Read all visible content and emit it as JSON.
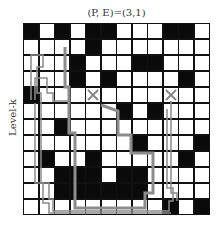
{
  "title": "(P, E)=(3,1)",
  "ylabel": "Level-k",
  "grid": {
    "rows": 12,
    "cols": 12,
    "cells": [
      "BWBWBBWWWBBW",
      "WWWWBWWWWWWW",
      "WWWBWWWBBWWW",
      "WWWBWBWWWWBW",
      "BWWWWWWWWWWW",
      "WWWWWWBWBWWW",
      "WWBWWWWWWWWW",
      "WWWWWWWBWWWB",
      "WBWWBWWWWWBW",
      "WWBBBWBBWWWW",
      "WWBBBBBBWWWW",
      "WWWWWWWWWBWB"
    ]
  },
  "markers": [
    {
      "type": "x",
      "row": 4,
      "col": 4
    },
    {
      "type": "x",
      "row": 4,
      "col": 9
    }
  ],
  "colors": {
    "wall": "#0a0a0a",
    "free": "#ffffff",
    "path": "#8c8c8c"
  }
}
